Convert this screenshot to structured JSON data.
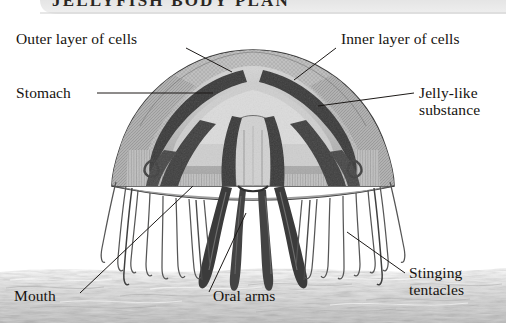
{
  "figure": {
    "kind": "anatomical-cross-section",
    "subject": "jellyfish",
    "banner": {
      "title": "JELLYFISH BODY PLAN",
      "note": "top of banner text is cropped off the top edge of the image"
    },
    "background_color": "#ffffff",
    "ink_color": "#16130f",
    "seafloor_color": "#c9c9c9",
    "bell_fill": "#9a9a9a",
    "bell_dark": "#4a4a4a",
    "labels": [
      {
        "id": "outer-layer-of-cells",
        "text": "Outer layer of cells",
        "x": 16,
        "y": 31,
        "leader": [
          [
            186,
            48
          ],
          [
            232,
            72
          ]
        ]
      },
      {
        "id": "inner-layer-of-cells",
        "text": "Inner layer of cells",
        "x": 341,
        "y": 31,
        "leader": [
          [
            336,
            48
          ],
          [
            294,
            80
          ]
        ]
      },
      {
        "id": "stomach",
        "text": "Stomach",
        "x": 16,
        "y": 85,
        "leader": [
          [
            97,
            93
          ],
          [
            213,
            93
          ]
        ]
      },
      {
        "id": "jelly-like-substance",
        "text": "Jelly-like\nsubstance",
        "x": 419,
        "y": 85,
        "leader": [
          [
            414,
            93
          ],
          [
            318,
            106
          ]
        ]
      },
      {
        "id": "mouth",
        "text": "Mouth",
        "x": 14,
        "y": 288,
        "leader": [
          [
            80,
            293
          ],
          [
            193,
            186
          ]
        ]
      },
      {
        "id": "oral-arms",
        "text": "Oral arms",
        "x": 213,
        "y": 288,
        "leader": [
          [
            209,
            292
          ],
          [
            246,
            213
          ]
        ]
      },
      {
        "id": "stinging-tentacles",
        "text": "Stinging\ntentacles",
        "x": 409,
        "y": 265,
        "leader": [
          [
            405,
            273
          ],
          [
            347,
            232
          ]
        ]
      }
    ]
  }
}
